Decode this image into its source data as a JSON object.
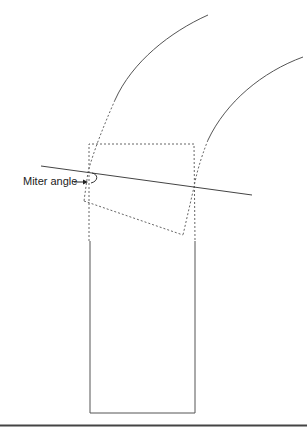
{
  "diagram": {
    "labels": {
      "miter_angle": "Miter angle"
    },
    "colors": {
      "stroke": "#555555",
      "dashed": "#666666",
      "rule": "#444444",
      "text": "#222222"
    }
  }
}
